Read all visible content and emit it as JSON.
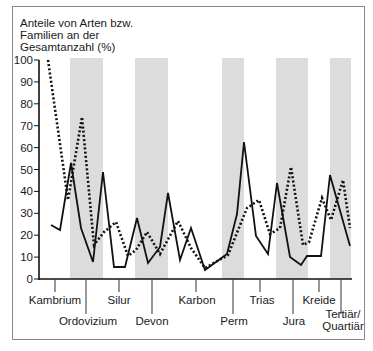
{
  "chart_data": {
    "type": "line",
    "title": "",
    "ylabel": "Anteile von Arten bzw. Familien an der Gesamtanzahl (%)",
    "ylabel_lines": [
      "Anteile von Arten bzw.",
      "Familien an der",
      "Gesamtanzahl (%)"
    ],
    "xlabel": "",
    "ylim": [
      0,
      100
    ],
    "yticks": [
      0,
      10,
      20,
      30,
      40,
      50,
      60,
      70,
      80,
      90,
      100
    ],
    "grid": false,
    "legend": null,
    "periods": [
      {
        "label": "Kambrium",
        "row": 1
      },
      {
        "label": "Ordovizium",
        "row": 2
      },
      {
        "label": "Silur",
        "row": 1
      },
      {
        "label": "Devon",
        "row": 2
      },
      {
        "label": "Karbon",
        "row": 1
      },
      {
        "label": "Perm",
        "row": 2
      },
      {
        "label": "Trias",
        "row": 1
      },
      {
        "label": "Jura",
        "row": 2
      },
      {
        "label": "Kreide",
        "row": 1
      },
      {
        "label": "Tertiär/ Quartiär",
        "row": 2
      }
    ],
    "shaded_bands": [
      {
        "from_px": 70,
        "to_px": 103
      },
      {
        "from_px": 135,
        "to_px": 168
      },
      {
        "from_px": 222,
        "to_px": 244
      },
      {
        "from_px": 276,
        "to_px": 308
      },
      {
        "from_px": 330,
        "to_px": 351
      }
    ],
    "series": [
      {
        "name": "solid",
        "style": "solid",
        "points_px": [
          [
            51,
            225
          ],
          [
            60,
            230
          ],
          [
            71,
            163
          ],
          [
            81,
            228
          ],
          [
            93,
            262
          ],
          [
            103,
            172
          ],
          [
            114,
            267
          ],
          [
            125,
            267
          ],
          [
            137,
            218
          ],
          [
            148,
            263
          ],
          [
            160,
            247
          ],
          [
            168,
            193
          ],
          [
            180,
            260
          ],
          [
            191,
            228
          ],
          [
            205,
            270
          ],
          [
            227,
            254
          ],
          [
            237,
            214
          ],
          [
            244,
            142
          ],
          [
            256,
            236
          ],
          [
            268,
            254
          ],
          [
            277,
            183
          ],
          [
            290,
            257
          ],
          [
            301,
            265
          ],
          [
            307,
            256
          ],
          [
            321,
            256
          ],
          [
            330,
            175
          ],
          [
            350,
            246
          ]
        ],
        "values": [
          25,
          22,
          53,
          23,
          8,
          49,
          5,
          5,
          28,
          7,
          15,
          39,
          9,
          23,
          4,
          11,
          30,
          63,
          20,
          11,
          44,
          10,
          6,
          11,
          11,
          47,
          15
        ]
      },
      {
        "name": "dotted",
        "style": "dotted",
        "points_px": [
          [
            48,
            60
          ],
          [
            68,
            200
          ],
          [
            82,
            117
          ],
          [
            94,
            245
          ],
          [
            104,
            232
          ],
          [
            116,
            222
          ],
          [
            128,
            256
          ],
          [
            136,
            250
          ],
          [
            147,
            232
          ],
          [
            160,
            254
          ],
          [
            178,
            221
          ],
          [
            191,
            248
          ],
          [
            205,
            268
          ],
          [
            228,
            255
          ],
          [
            247,
            208
          ],
          [
            259,
            200
          ],
          [
            270,
            234
          ],
          [
            280,
            228
          ],
          [
            291,
            167
          ],
          [
            303,
            245
          ],
          [
            309,
            242
          ],
          [
            322,
            198
          ],
          [
            331,
            220
          ],
          [
            343,
            180
          ],
          [
            350,
            228
          ]
        ],
        "values": [
          100,
          36,
          74,
          16,
          21,
          26,
          10,
          13,
          21,
          11,
          26,
          14,
          5,
          11,
          32,
          36,
          21,
          23,
          51,
          15,
          17,
          37,
          27,
          45,
          23
        ]
      }
    ]
  },
  "axis": {
    "x0": 39,
    "x1": 352,
    "y_top": 60,
    "y_bottom": 279,
    "ticks_px": [
      {
        "x": 55,
        "long": false
      },
      {
        "x": 86,
        "long": true
      },
      {
        "x": 119,
        "long": false
      },
      {
        "x": 152,
        "long": true
      },
      {
        "x": 196,
        "long": false
      },
      {
        "x": 233,
        "long": true
      },
      {
        "x": 260,
        "long": false
      },
      {
        "x": 293,
        "long": true
      },
      {
        "x": 319,
        "long": false
      },
      {
        "x": 341,
        "long": true
      }
    ]
  },
  "colors": {
    "line": "#111111",
    "band": "#dcdcdc",
    "frame": "#8a8a8a"
  }
}
